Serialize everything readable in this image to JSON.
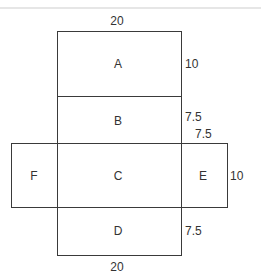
{
  "diagram": {
    "type": "net-of-rectangular-prism",
    "faces": [
      {
        "id": "A",
        "label": "A"
      },
      {
        "id": "B",
        "label": "B"
      },
      {
        "id": "C",
        "label": "C"
      },
      {
        "id": "D",
        "label": "D"
      },
      {
        "id": "E",
        "label": "E"
      },
      {
        "id": "F",
        "label": "F"
      }
    ],
    "dimensions": {
      "top_width": "20",
      "a_height": "10",
      "b_height": "7.5",
      "e_width": "7.5",
      "e_height": "10",
      "d_height": "7.5",
      "bottom_width": "20"
    }
  }
}
